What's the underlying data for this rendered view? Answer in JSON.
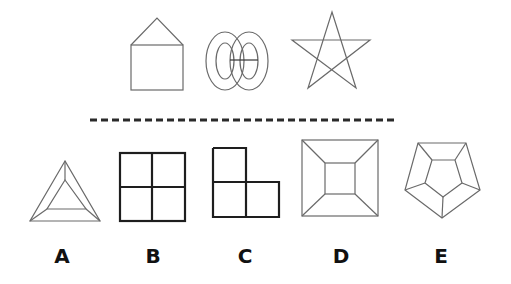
{
  "puzzle": {
    "question_figures": [
      {
        "id": "house",
        "description": "square with triangular roof"
      },
      {
        "id": "double-ring",
        "description": "two concentric ellipse pairs joined by a line"
      },
      {
        "id": "pentagram",
        "description": "five-pointed star"
      }
    ],
    "separator": "dashed-line",
    "options": [
      {
        "label": "A",
        "description": "triangle with inner triangle, corners connected"
      },
      {
        "label": "B",
        "description": "2x2 grid of squares"
      },
      {
        "label": "C",
        "description": "L-shape of three squares"
      },
      {
        "label": "D",
        "description": "square with inner square, corners connected"
      },
      {
        "label": "E",
        "description": "pentagon with inner pentagon, corners connected"
      }
    ]
  },
  "colors": {
    "thin_stroke": "#6a6a6a",
    "thick_stroke": "#1e1e1e",
    "background": "#ffffff"
  }
}
